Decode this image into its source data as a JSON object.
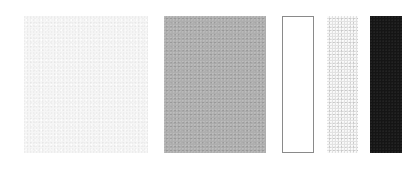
{
  "swatches": [
    {
      "id": "swatch-1",
      "style": "very-light-textured",
      "color": "#f6f6f6",
      "x": 24,
      "y": 16,
      "width": 124,
      "height": 137
    },
    {
      "id": "swatch-2",
      "style": "mid-gray-textured",
      "color": "#a9a9a9",
      "x": 164,
      "y": 16,
      "width": 102,
      "height": 137
    },
    {
      "id": "swatch-3",
      "style": "white-outlined",
      "color": "#ffffff",
      "border_color": "#8a8a8a",
      "x": 282,
      "y": 16,
      "width": 32,
      "height": 137
    },
    {
      "id": "swatch-4",
      "style": "light-gray-speckled",
      "color": "#e2e2e2",
      "x": 327,
      "y": 16,
      "width": 31,
      "height": 137
    },
    {
      "id": "swatch-5",
      "style": "black-solid",
      "color": "#151515",
      "x": 370,
      "y": 16,
      "width": 32,
      "height": 137
    }
  ]
}
